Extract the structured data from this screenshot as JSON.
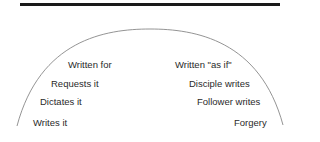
{
  "diagram": {
    "type": "semicircle-spectrum",
    "colors": {
      "rule": "#1a1a1a",
      "arc": "#888888",
      "text": "#2a2a2a"
    },
    "left_labels": [
      {
        "text": "Written for",
        "x": 68,
        "y": 60
      },
      {
        "text": "Requests it",
        "x": 51,
        "y": 79
      },
      {
        "text": "Dictates it",
        "x": 40,
        "y": 97
      },
      {
        "text": "Writes it",
        "x": 33,
        "y": 118
      }
    ],
    "right_labels": [
      {
        "text": "Written \"as if\"",
        "x": 175,
        "y": 60
      },
      {
        "text": "Disciple writes",
        "x": 189,
        "y": 79
      },
      {
        "text": "Follower writes",
        "x": 197,
        "y": 97
      },
      {
        "text": "Forgery",
        "x": 234,
        "y": 118
      }
    ]
  }
}
